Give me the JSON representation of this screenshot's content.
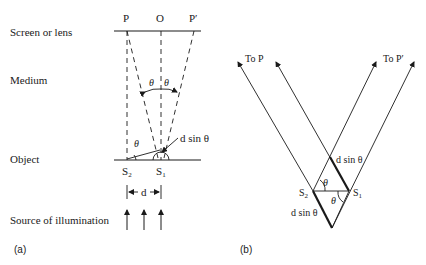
{
  "panel_a": {
    "caption": "(a)",
    "row_labels": {
      "screen": "Screen or lens",
      "medium": "Medium",
      "object": "Object",
      "source": "Source of illumination"
    },
    "points": {
      "p": "P",
      "o": "O",
      "p_prime": "P′"
    },
    "sources": {
      "s2": "S",
      "s2_sub": "2",
      "s1": "S",
      "s1_sub": "1"
    },
    "theta": "θ",
    "path_difference": "d sin θ",
    "separation": "d"
  },
  "panel_b": {
    "caption": "(b)",
    "to_p": "To P",
    "to_p_prime": "To P′",
    "sources": {
      "s2": "S",
      "s2_sub": "2",
      "s1": "S",
      "s1_sub": "1"
    },
    "theta": "θ",
    "path_difference_upper": "d sin θ",
    "path_difference_lower": "d sin θ"
  },
  "colors": {
    "ink": "#1a1a1a",
    "background": "#ffffff"
  }
}
